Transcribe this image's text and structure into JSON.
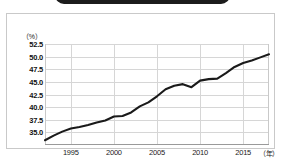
{
  "banner": {
    "label": "",
    "color": "#1c1c1c"
  },
  "chart_data": {
    "type": "line",
    "title": "",
    "xlabel": "年",
    "ylabel": "（%）",
    "unit_note": "（%）",
    "xlim": [
      1992,
      2018
    ],
    "ylim": [
      33.75,
      53.75
    ],
    "grid": true,
    "legend": "none",
    "line_color": "#1a1a1a",
    "y_ticks": [
      "52.5",
      "50.0",
      "47.5",
      "45.0",
      "42.5",
      "40.0",
      "37.5",
      "35.0"
    ],
    "y_tick_values": [
      52.5,
      50.0,
      47.5,
      45.0,
      42.5,
      40.0,
      37.5,
      35.0
    ],
    "x_ticks": [
      "1995",
      "2000",
      "2005",
      "2010",
      "2015"
    ],
    "x_tick_values": [
      1995,
      2000,
      2005,
      2010,
      2015
    ],
    "x": [
      1992,
      1993,
      1994,
      1995,
      1996,
      1997,
      1998,
      1999,
      2000,
      2001,
      2002,
      2003,
      2004,
      2005,
      2006,
      2007,
      2008,
      2009,
      2010,
      2011,
      2012,
      2013,
      2014,
      2015,
      2016,
      2017,
      2018
    ],
    "values": [
      34.7,
      35.6,
      36.4,
      37.0,
      37.3,
      37.7,
      38.2,
      38.6,
      39.4,
      39.5,
      40.2,
      41.4,
      42.2,
      43.4,
      44.8,
      45.5,
      45.8,
      45.2,
      46.5,
      46.8,
      46.9,
      48.0,
      49.2,
      50.0,
      50.5,
      51.1,
      51.7
    ]
  }
}
